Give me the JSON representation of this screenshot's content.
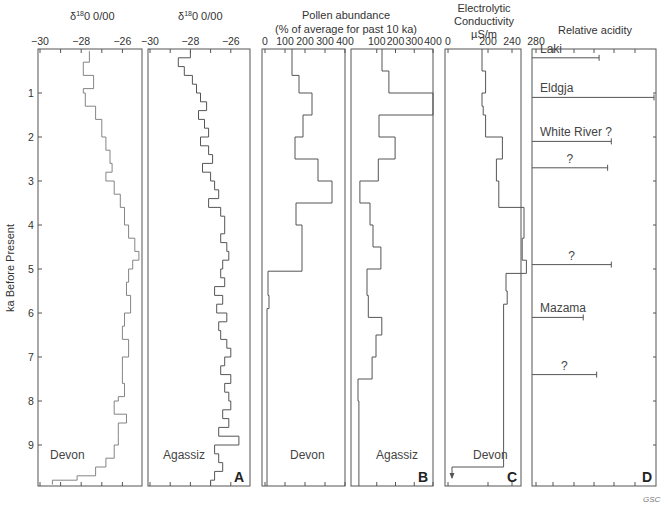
{
  "chart_data": [
    {
      "panel": "A",
      "type": "line",
      "title": "δ18O 0/00",
      "xlabel": "δ18O 0/00",
      "ylabel": "ka Before Present",
      "x_ticks": [
        -30,
        -28,
        -26
      ],
      "ylim": [
        0,
        10
      ],
      "y_ticks": [
        1,
        2,
        3,
        4,
        5,
        6,
        7,
        8,
        9
      ],
      "series": [
        {
          "name": "Devon",
          "ka": [
            0.05,
            0.3,
            0.6,
            0.9,
            1.0,
            1.3,
            1.6,
            1.8,
            2.0,
            2.3,
            2.6,
            2.8,
            3.0,
            3.3,
            3.6,
            4.0,
            4.3,
            4.6,
            4.8,
            5.0,
            5.3,
            5.6,
            6.0,
            6.3,
            6.6,
            7.0,
            7.3,
            7.6,
            7.9,
            8.0,
            8.3,
            8.5,
            8.8,
            9.0,
            9.3,
            9.5,
            9.7,
            9.8
          ],
          "values": [
            -27.6,
            -27.9,
            -27.4,
            -27.9,
            -27.8,
            -27.3,
            -27.0,
            -27.0,
            -26.8,
            -26.6,
            -26.5,
            -26.8,
            -26.4,
            -26.1,
            -25.9,
            -25.7,
            -25.4,
            -25.2,
            -25.5,
            -25.7,
            -25.8,
            -25.6,
            -25.9,
            -26.0,
            -25.7,
            -26.0,
            -26.0,
            -25.9,
            -26.2,
            -26.4,
            -25.8,
            -26.2,
            -26.2,
            -26.4,
            -26.8,
            -27.3,
            -28.2,
            -29.4
          ]
        },
        {
          "name": "Agassiz",
          "ka": [
            0.05,
            0.2,
            0.4,
            0.6,
            0.8,
            1.0,
            1.2,
            1.4,
            1.6,
            1.8,
            2.0,
            2.2,
            2.4,
            2.6,
            2.8,
            3.0,
            3.2,
            3.4,
            3.6,
            3.8,
            4.0,
            4.2,
            4.4,
            4.6,
            4.8,
            5.0,
            5.2,
            5.4,
            5.6,
            5.8,
            6.0,
            6.2,
            6.4,
            6.6,
            6.8,
            7.0,
            7.2,
            7.4,
            7.6,
            7.8,
            8.0,
            8.2,
            8.4,
            8.6,
            8.8,
            9.0,
            9.2,
            9.4,
            9.6,
            9.8
          ],
          "values": [
            -28.0,
            -28.6,
            -28.3,
            -27.9,
            -27.7,
            -27.5,
            -27.2,
            -27.6,
            -27.3,
            -27.1,
            -27.5,
            -27.1,
            -26.9,
            -27.4,
            -27.0,
            -26.8,
            -26.6,
            -27.1,
            -26.5,
            -26.3,
            -26.3,
            -26.5,
            -26.2,
            -26.1,
            -26.4,
            -26.5,
            -26.3,
            -26.8,
            -26.4,
            -26.7,
            -26.2,
            -26.6,
            -26.5,
            -26.2,
            -26.0,
            -26.3,
            -26.5,
            -26.0,
            -26.3,
            -26.1,
            -26.0,
            -26.4,
            -26.1,
            -26.6,
            -25.6,
            -26.8,
            -26.6,
            -26.4,
            -26.8,
            -27.0
          ]
        }
      ]
    },
    {
      "panel": "B",
      "type": "line",
      "title": "Pollen abundance (% of average for past 10 ka)",
      "x_ticks_devon": [
        0,
        100,
        200,
        300,
        400
      ],
      "x_ticks_agassiz": [
        100,
        200,
        300,
        400
      ],
      "series": [
        {
          "name": "Devon",
          "ka_edges": [
            0,
            0.6,
            1.0,
            1.5,
            2.0,
            2.5,
            3.0,
            3.5,
            4.0,
            5.05,
            5.6,
            5.9,
            10.0
          ],
          "values": [
            135,
            170,
            235,
            190,
            150,
            265,
            335,
            155,
            185,
            15,
            20,
            10
          ]
        },
        {
          "name": "Agassiz",
          "ka_edges": [
            0,
            0.5,
            1.0,
            1.5,
            2.0,
            2.5,
            3.0,
            3.5,
            4.0,
            4.5,
            5.0,
            5.6,
            6.1,
            6.5,
            7.0,
            7.5,
            8.0,
            10.0
          ],
          "values": [
            128,
            165,
            400,
            112,
            198,
            108,
            10,
            64,
            80,
            122,
            48,
            55,
            127,
            96,
            75,
            0,
            5
          ]
        }
      ]
    },
    {
      "panel": "C",
      "type": "line",
      "title": "Electrolytic Conductivity µS/m",
      "x_ticks": [
        0,
        200,
        240,
        280
      ],
      "series": [
        {
          "name": "Devon",
          "ka_edges": [
            0,
            0.5,
            1.0,
            1.3,
            1.5,
            2.0,
            2.5,
            3.0,
            3.6,
            4.3,
            4.8,
            5.1,
            5.5,
            5.8,
            9.5
          ],
          "values": [
            190,
            196,
            190,
            192,
            196,
            224,
            214,
            218,
            260,
            257,
            264,
            230,
            232,
            226,
            40
          ]
        }
      ],
      "arrow_at_bottom": true
    },
    {
      "panel": "D",
      "type": "bar",
      "title": "Relative acidity",
      "events": [
        {
          "label": "Laki",
          "ka": 0.2,
          "value": 0.55
        },
        {
          "label": "Eldgja",
          "ka": 1.1,
          "value": 1.0
        },
        {
          "label": "White River ?",
          "ka": 2.1,
          "value": 0.65
        },
        {
          "label": "?",
          "ka": 2.7,
          "value": 0.62
        },
        {
          "label": "?",
          "ka": 4.9,
          "value": 0.65
        },
        {
          "label": "Mazama",
          "ka": 6.1,
          "value": 0.42
        },
        {
          "label": "?",
          "ka": 7.4,
          "value": 0.53
        }
      ]
    }
  ],
  "labels": {
    "d18o_title": "δ",
    "d18o_sup": "18",
    "d18o_unit": "0 0/00",
    "pollen_title_1": "Pollen abundance",
    "pollen_title_2": "(% of average for past 10 ka)",
    "cond_title_1": "Electrolytic",
    "cond_title_2": "Conductivity",
    "cond_title_3": "µS/m",
    "acid_title": "Relative acidity",
    "ylabel": "ka Before Present",
    "site_devon": "Devon",
    "site_agassiz": "Agassiz",
    "panel_a": "A",
    "panel_b": "B",
    "panel_c": "C",
    "panel_d": "D",
    "credit": "GSC"
  }
}
